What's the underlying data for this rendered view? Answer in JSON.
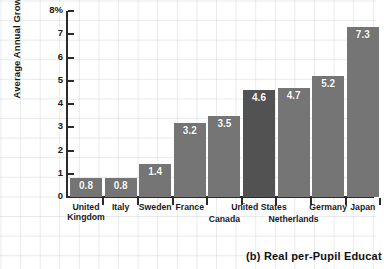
{
  "chart_data": {
    "type": "bar",
    "title": "",
    "xlabel": "",
    "ylabel": "Average Annual Growth Rates",
    "ylim": [
      0,
      8
    ],
    "ytick_labels": [
      "8%",
      "7",
      "6",
      "5",
      "4",
      "3",
      "2",
      "1",
      "0"
    ],
    "ytick_values": [
      8,
      7,
      6,
      5,
      4,
      3,
      2,
      1,
      0
    ],
    "grid": true,
    "legend": null,
    "categories": [
      "United Kingdom",
      "Italy",
      "Sweden",
      "France",
      "Canada",
      "United States",
      "Netherlands",
      "Germany",
      "Japan"
    ],
    "values": [
      0.8,
      0.8,
      1.4,
      3.2,
      3.5,
      4.6,
      4.7,
      5.2,
      7.3
    ],
    "data_labels": [
      "0.8",
      "0.8",
      "1.4",
      "3.2",
      "3.5",
      "4.6",
      "4.7",
      "5.2",
      "7.3"
    ],
    "highlight_index": 5,
    "bar_color": "#757575",
    "bar_color_highlight": "#525252",
    "label_rows": [
      0,
      0,
      0,
      0,
      1,
      0,
      1,
      0,
      0
    ],
    "category_lines": [
      [
        "United",
        "Kingdom"
      ],
      [
        "Italy"
      ],
      [
        "Sweden"
      ],
      [
        "France"
      ],
      [
        "Canada"
      ],
      [
        "United States"
      ],
      [
        "Netherlands"
      ],
      [
        "Germany"
      ],
      [
        "Japan"
      ]
    ]
  },
  "caption": {
    "text": "(b) Real per-Pupil Educat"
  }
}
